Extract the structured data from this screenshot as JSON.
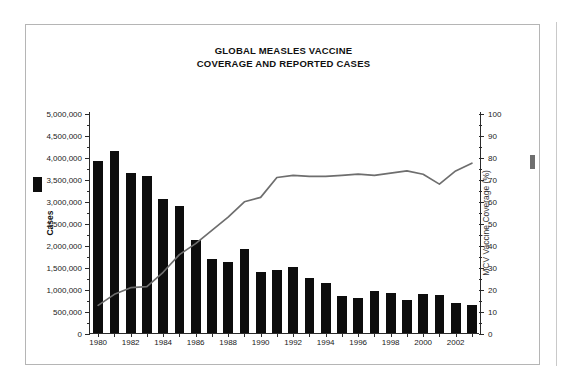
{
  "figure": {
    "title_line1": "GLOBAL MEASLES VACCINE",
    "title_line2": "COVERAGE AND REPORTED CASES",
    "bar_color": "#0d0d0d",
    "line_color": "#6e6e6e",
    "frame_color": "#b5b5b5"
  },
  "chart_data": {
    "type": "bar",
    "title": "GLOBAL MEASLES VACCINE COVERAGE AND REPORTED CASES",
    "xlabel": "",
    "ylabel": "Cases",
    "y2label": "MCV Vaccine Coverage (%)",
    "grid": false,
    "legend_position": "axis-labels",
    "ylim": [
      0,
      5000000
    ],
    "y2lim": [
      0,
      100
    ],
    "ytick_step": 500000,
    "y2tick_step": 10,
    "yminor_step": 250000,
    "y2minor_step": 5,
    "categories": [
      1980,
      1981,
      1982,
      1983,
      1984,
      1985,
      1986,
      1987,
      1988,
      1989,
      1990,
      1991,
      1992,
      1993,
      1994,
      1995,
      1996,
      1997,
      1998,
      1999,
      2000,
      2001,
      2002,
      2003
    ],
    "xtick_labels": [
      "1980",
      "1982",
      "1984",
      "1986",
      "1988",
      "1990",
      "1992",
      "1994",
      "1996",
      "1998",
      "2000",
      "2002"
    ],
    "ytick_labels": [
      "0",
      "500,000",
      "1,000,000",
      "1,500,000",
      "2,000,000",
      "2,500,000",
      "3,000,000",
      "3,500,000",
      "4,000,000",
      "4,500,000",
      "5,000,000"
    ],
    "y2tick_labels": [
      "0",
      "10",
      "20",
      "30",
      "40",
      "50",
      "60",
      "70",
      "80",
      "90",
      "100"
    ],
    "series": [
      {
        "name": "Cases",
        "type": "bar",
        "axis": "left",
        "color": "#0d0d0d",
        "values": [
          3900000,
          4120000,
          3620000,
          3560000,
          3050000,
          2880000,
          2100000,
          1680000,
          1620000,
          1900000,
          1380000,
          1440000,
          1500000,
          1250000,
          1130000,
          850000,
          800000,
          950000,
          900000,
          750000,
          880000,
          870000,
          690000,
          630000
        ]
      },
      {
        "name": "MCV Vaccine Coverage (%)",
        "type": "line",
        "axis": "right",
        "color": "#6e6e6e",
        "values": [
          13,
          18,
          21,
          21.5,
          28,
          36,
          41,
          47,
          53,
          60,
          62,
          71,
          72,
          71.5,
          71.5,
          72,
          72.5,
          72,
          73,
          74,
          72.5,
          68,
          74,
          77.5
        ]
      }
    ]
  }
}
